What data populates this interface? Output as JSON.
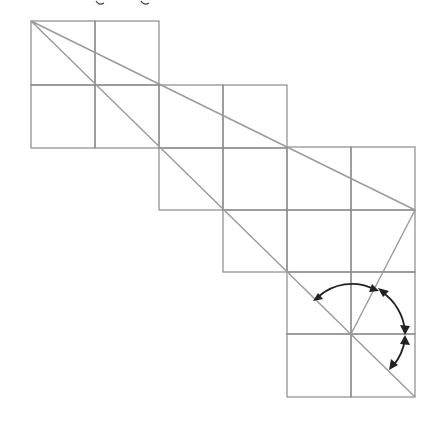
{
  "figure": {
    "type": "geometry-grid-diagram",
    "cell_size_px": 64,
    "colors": {
      "grid": "#8a8a8a",
      "diagonals": "#9a9a9a",
      "arcs": "#222222",
      "background": "#ffffff"
    },
    "rows": [
      {
        "row": 0,
        "first_col": 0,
        "last_col": 1
      },
      {
        "row": 1,
        "first_col": 0,
        "last_col": 3
      },
      {
        "row": 2,
        "first_col": 2,
        "last_col": 5
      },
      {
        "row": 3,
        "first_col": 3,
        "last_col": 5
      },
      {
        "row": 4,
        "first_col": 4,
        "last_col": 5
      },
      {
        "row": 5,
        "first_col": 4,
        "last_col": 5
      }
    ],
    "lines": [
      {
        "name": "shallow-diagonal",
        "from": [
          0,
          0
        ],
        "to": [
          6,
          3
        ]
      },
      {
        "name": "main-diagonal",
        "from": [
          0,
          0
        ],
        "to": [
          6,
          6
        ]
      },
      {
        "name": "connector-line",
        "from": [
          6,
          3
        ],
        "to": [
          5,
          5
        ]
      }
    ],
    "angle_marks": {
      "vertex": [
        5,
        5
      ],
      "arcs": [
        {
          "name": "arc-1",
          "between": [
            "main-diagonal",
            "connector-line"
          ],
          "style": "double-headed"
        },
        {
          "name": "arc-2",
          "between": [
            "connector-line",
            "horizontal-grid-line"
          ],
          "style": "double-headed"
        },
        {
          "name": "arc-3",
          "between": [
            "horizontal-grid-line",
            "main-diagonal"
          ],
          "style": "double-headed"
        }
      ]
    },
    "top_fragment": "cropped text descenders (g g)"
  }
}
